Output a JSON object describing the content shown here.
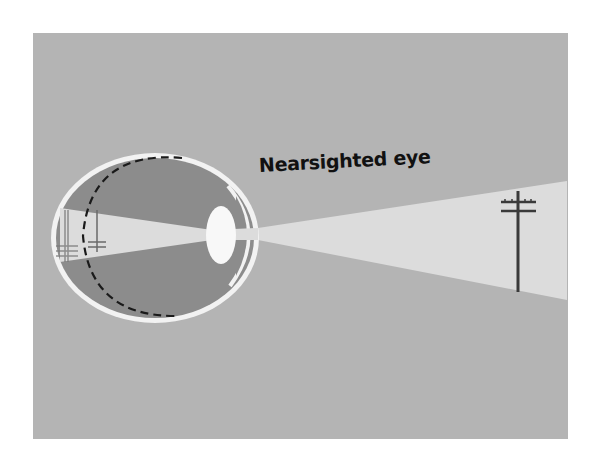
{
  "diagram": {
    "title": "Nearsighted eye",
    "colors": {
      "background": "#ffffff",
      "panel": "#b4b4b4",
      "eye_interior": "#8c8c8c",
      "light_cone": "#dcdcdc",
      "lens": "#f8f8f8",
      "eye_outline": "#f2f2f2",
      "pole": "#3a3a3a",
      "dashed_retina": "#1a1a1a"
    },
    "elements": [
      {
        "name": "eyeball",
        "label": ""
      },
      {
        "name": "lens",
        "label": ""
      },
      {
        "name": "cornea",
        "label": ""
      },
      {
        "name": "normal-retina-dashed-line",
        "label": ""
      },
      {
        "name": "light-cone",
        "label": ""
      },
      {
        "name": "utility-pole-object",
        "label": ""
      },
      {
        "name": "focused-image-inside-eye",
        "label": ""
      },
      {
        "name": "blurred-image-on-retina",
        "label": ""
      }
    ]
  }
}
